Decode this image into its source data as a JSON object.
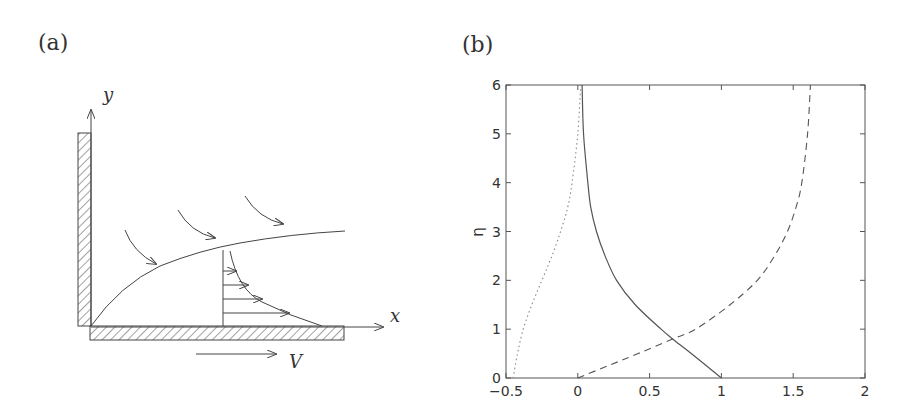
{
  "panel_a": {
    "label": "(a)",
    "y_axis_label": "y",
    "x_axis_label": "x",
    "wall_velocity_label": "V",
    "description": "Schematic of boundary layer on a moving wall with flow entrainment arrows and velocity profile"
  },
  "panel_b": {
    "label": "(b)"
  },
  "chart_data": {
    "type": "line",
    "title": "",
    "xlabel": "",
    "ylabel": "η",
    "xlim": [
      -0.5,
      2
    ],
    "ylim": [
      0,
      6
    ],
    "x_ticks": [
      "-0.5",
      "0",
      "0.5",
      "1",
      "1.5",
      "2"
    ],
    "y_ticks": [
      "0",
      "1",
      "2",
      "3",
      "4",
      "5",
      "6"
    ],
    "grid": false,
    "legend": null,
    "series": [
      {
        "name": "solid",
        "style": "solid",
        "eta": [
          0,
          0.5,
          0.8,
          1,
          1.5,
          2,
          2.5,
          3,
          3.5,
          4,
          5,
          6
        ],
        "x": [
          1.0,
          0.79,
          0.66,
          0.58,
          0.4,
          0.27,
          0.19,
          0.13,
          0.09,
          0.07,
          0.04,
          0.03
        ]
      },
      {
        "name": "dashed",
        "style": "dashed",
        "eta": [
          0,
          0.25,
          0.5,
          0.8,
          1,
          1.5,
          2,
          2.5,
          3,
          3.5,
          4,
          5,
          6
        ],
        "x": [
          0.0,
          0.21,
          0.42,
          0.66,
          0.82,
          1.06,
          1.25,
          1.37,
          1.46,
          1.52,
          1.56,
          1.6,
          1.62
        ]
      },
      {
        "name": "dotted",
        "style": "dotted",
        "eta": [
          0,
          0.5,
          1,
          1.5,
          2,
          2.5,
          3,
          3.5,
          4,
          5,
          6
        ],
        "x": [
          -0.45,
          -0.42,
          -0.38,
          -0.32,
          -0.25,
          -0.18,
          -0.12,
          -0.07,
          -0.04,
          0.0,
          0.02
        ]
      }
    ]
  }
}
